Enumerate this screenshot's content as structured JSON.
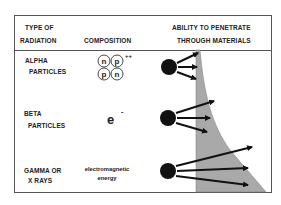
{
  "header": {
    "col1_line1": "TYPE OF",
    "col1_line2": "RADIATION",
    "col2": "COMPOSITION",
    "col3_line1": "ABILITY TO PENETRATE",
    "col3_line2": "THROUGH MATERIALS"
  },
  "rows": [
    {
      "type_line1": "ALPHA",
      "type_line2": "PARTICLES",
      "composition": {
        "nucleons": [
          "n",
          "p",
          "p",
          "n"
        ],
        "charge": "++"
      }
    },
    {
      "type_line1": "BETA",
      "type_line2": "PARTICLES",
      "composition": {
        "symbol": "e",
        "charge": "-"
      }
    },
    {
      "type_line1": "GAMMA OR",
      "type_line2": "X RAYS",
      "composition": {
        "line1": "electromagnetic",
        "line2": "energy"
      }
    }
  ],
  "colors": {
    "border": "#555555",
    "shaded_material": "#a9a9a9",
    "particle": "#111111",
    "text": "#222222"
  }
}
